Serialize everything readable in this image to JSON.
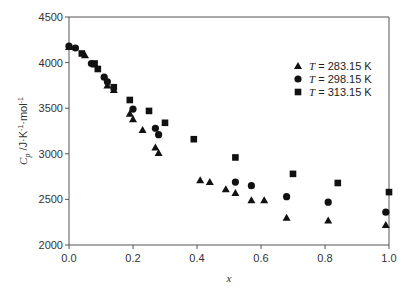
{
  "chart_data": {
    "type": "scatter",
    "title": "",
    "xlabel": "x",
    "ylabel": "C_p /J·K⁻¹·mol⁻¹",
    "xlim": [
      0.0,
      1.0
    ],
    "ylim": [
      2000,
      4500
    ],
    "xticks": [
      "0.0",
      "0.2",
      "0.4",
      "0.6",
      "0.8",
      "1.0"
    ],
    "yticks": [
      "2000",
      "2500",
      "3000",
      "3500",
      "4000",
      "4500"
    ],
    "grid": false,
    "legend_position": "upper right",
    "series": [
      {
        "name": "T = 283.15 K",
        "marker": "triangle",
        "points": [
          [
            0.0,
            4170
          ],
          [
            0.05,
            4080
          ],
          [
            0.08,
            3980
          ],
          [
            0.12,
            3750
          ],
          [
            0.14,
            3700
          ],
          [
            0.19,
            3440
          ],
          [
            0.2,
            3380
          ],
          [
            0.23,
            3260
          ],
          [
            0.27,
            3070
          ],
          [
            0.28,
            3010
          ],
          [
            0.41,
            2710
          ],
          [
            0.44,
            2690
          ],
          [
            0.49,
            2610
          ],
          [
            0.52,
            2570
          ],
          [
            0.57,
            2490
          ],
          [
            0.61,
            2490
          ],
          [
            0.68,
            2300
          ],
          [
            0.81,
            2270
          ],
          [
            0.99,
            2220
          ]
        ]
      },
      {
        "name": "T = 298.15 K",
        "marker": "circle",
        "points": [
          [
            0.0,
            4180
          ],
          [
            0.02,
            4160
          ],
          [
            0.07,
            3990
          ],
          [
            0.11,
            3840
          ],
          [
            0.12,
            3790
          ],
          [
            0.2,
            3490
          ],
          [
            0.27,
            3280
          ],
          [
            0.28,
            3210
          ],
          [
            0.52,
            2690
          ],
          [
            0.57,
            2650
          ],
          [
            0.68,
            2530
          ],
          [
            0.81,
            2470
          ],
          [
            0.99,
            2360
          ]
        ]
      },
      {
        "name": "T = 313.15 K",
        "marker": "square",
        "points": [
          [
            0.04,
            4100
          ],
          [
            0.08,
            3990
          ],
          [
            0.09,
            3930
          ],
          [
            0.14,
            3730
          ],
          [
            0.19,
            3590
          ],
          [
            0.25,
            3470
          ],
          [
            0.3,
            3340
          ],
          [
            0.39,
            3160
          ],
          [
            0.52,
            2960
          ],
          [
            0.7,
            2780
          ],
          [
            0.84,
            2680
          ],
          [
            1.0,
            2580
          ]
        ]
      }
    ]
  },
  "legend": {
    "items": [
      {
        "t": "T",
        "rest": " = 283.15 K",
        "marker": "triangle"
      },
      {
        "t": "T",
        "rest": " = 298.15 K",
        "marker": "circle"
      },
      {
        "t": "T",
        "rest": " = 313.15 K",
        "marker": "square"
      }
    ]
  },
  "labels": {
    "xlabel": "x",
    "ylabel_main": "C",
    "ylabel_sub": "p",
    "ylabel_units": " /J·K",
    "ylabel_sup1": "-1",
    "ylabel_mid": "·mol",
    "ylabel_sup2": "-1"
  }
}
